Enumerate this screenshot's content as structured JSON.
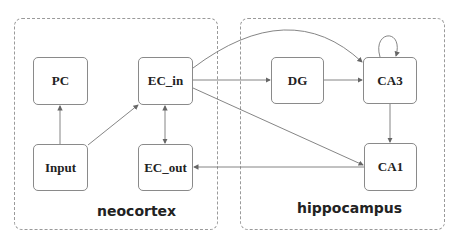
{
  "regions": {
    "neocortex": {
      "label": "neocortex"
    },
    "hippocampus": {
      "label": "hippocampus"
    }
  },
  "nodes": {
    "pc": "PC",
    "ec_in": "EC_in",
    "input": "Input",
    "ec_out": "EC_out",
    "dg": "DG",
    "ca3": "CA3",
    "ca1": "CA1"
  },
  "edges": [
    {
      "from": "Input",
      "to": "PC"
    },
    {
      "from": "Input",
      "to": "EC_in"
    },
    {
      "from": "EC_in",
      "to": "EC_out",
      "bidirectional": true
    },
    {
      "from": "EC_in",
      "to": "DG"
    },
    {
      "from": "EC_in",
      "to": "CA3"
    },
    {
      "from": "EC_in",
      "to": "CA1"
    },
    {
      "from": "DG",
      "to": "CA3"
    },
    {
      "from": "CA3",
      "to": "CA3"
    },
    {
      "from": "CA3",
      "to": "CA1"
    },
    {
      "from": "CA1",
      "to": "EC_out"
    }
  ]
}
